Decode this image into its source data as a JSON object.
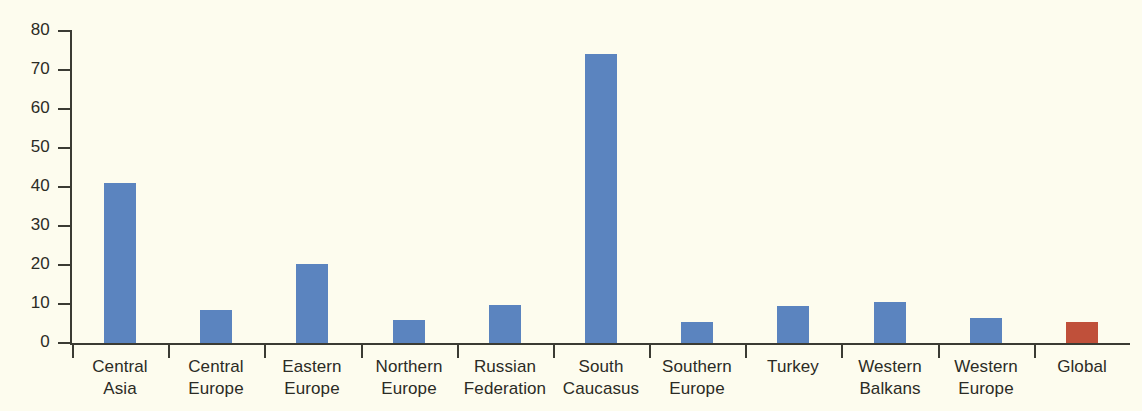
{
  "chart_data": {
    "type": "bar",
    "title": "",
    "subtitle": "",
    "xlabel": "",
    "ylabel": "",
    "ylim": [
      0,
      80
    ],
    "ytick_labels": [
      "80",
      "70",
      "60",
      "50",
      "40",
      "30",
      "20",
      "10",
      "0"
    ],
    "ytick_values": [
      80,
      70,
      60,
      50,
      40,
      30,
      20,
      10,
      0
    ],
    "grid": false,
    "legend": false,
    "categories": [
      "Central Asia",
      "Central Europe",
      "Eastern Europe",
      "Northern Europe",
      "Russian Federation",
      "South Caucasus",
      "Southern Europe",
      "Turkey",
      "Western Balkans",
      "Western Europe",
      "Global"
    ],
    "category_lines": [
      [
        "Central",
        "Asia"
      ],
      [
        "Central",
        "Europe"
      ],
      [
        "Eastern",
        "Europe"
      ],
      [
        "Northern",
        "Europe"
      ],
      [
        "Russian",
        "Federation"
      ],
      [
        "South",
        "Caucasus"
      ],
      [
        "Southern",
        "Europe"
      ],
      [
        "Turkey",
        ""
      ],
      [
        "Western",
        "Balkans"
      ],
      [
        "Western",
        "Europe"
      ],
      [
        "Global",
        ""
      ]
    ],
    "values": [
      41,
      8.5,
      20.3,
      5.9,
      9.7,
      74,
      5.4,
      9.4,
      10.5,
      6.4,
      5.5
    ],
    "bar_colors": [
      "#5b84bf",
      "#5b84bf",
      "#5b84bf",
      "#5b84bf",
      "#5b84bf",
      "#5b84bf",
      "#5b84bf",
      "#5b84bf",
      "#5b84bf",
      "#5b84bf",
      "#c0503a"
    ]
  },
  "colors": {
    "background": "#fdfcee",
    "series_blue": "#5b84bf",
    "highlight_red": "#c0503a",
    "axis": "#3b3b33",
    "text": "#2b2b25"
  }
}
